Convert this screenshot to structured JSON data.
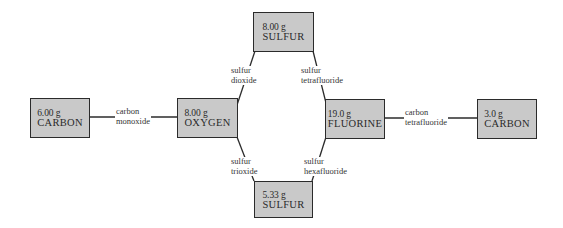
{
  "nodes": {
    "carbon_left": {
      "mass": "6.00 g",
      "element": "CARBON"
    },
    "oxygen": {
      "mass": "8.00 g",
      "element": "OXYGEN"
    },
    "sulfur_top": {
      "mass": "8.00 g",
      "element": "SULFUR"
    },
    "fluorine": {
      "mass": "19.0 g",
      "element": "FLUORINE"
    },
    "carbon_right": {
      "mass": "3.0 g",
      "element": "CARBON"
    },
    "sulfur_bottom": {
      "mass": "5.33 g",
      "element": "SULFUR"
    }
  },
  "edges": {
    "carbon_monoxide": {
      "line1": "carbon",
      "line2": "monoxide"
    },
    "sulfur_dioxide": {
      "line1": "sulfur",
      "line2": "dioxide"
    },
    "sulfur_tetrafluoride": {
      "line1": "sulfur",
      "line2": "tetrafluoride"
    },
    "sulfur_trioxide": {
      "line1": "sulfur",
      "line2": "trioxide"
    },
    "sulfur_hexafluoride": {
      "line1": "sulfur",
      "line2": "hexafluoride"
    },
    "carbon_tetrafluoride": {
      "line1": "carbon",
      "line2": "tetrafluoride"
    }
  },
  "colors": {
    "box_fill": "#c9c9c9",
    "box_border": "#2b2b2b",
    "line": "#2b2b2b",
    "background": "#ffffff"
  }
}
